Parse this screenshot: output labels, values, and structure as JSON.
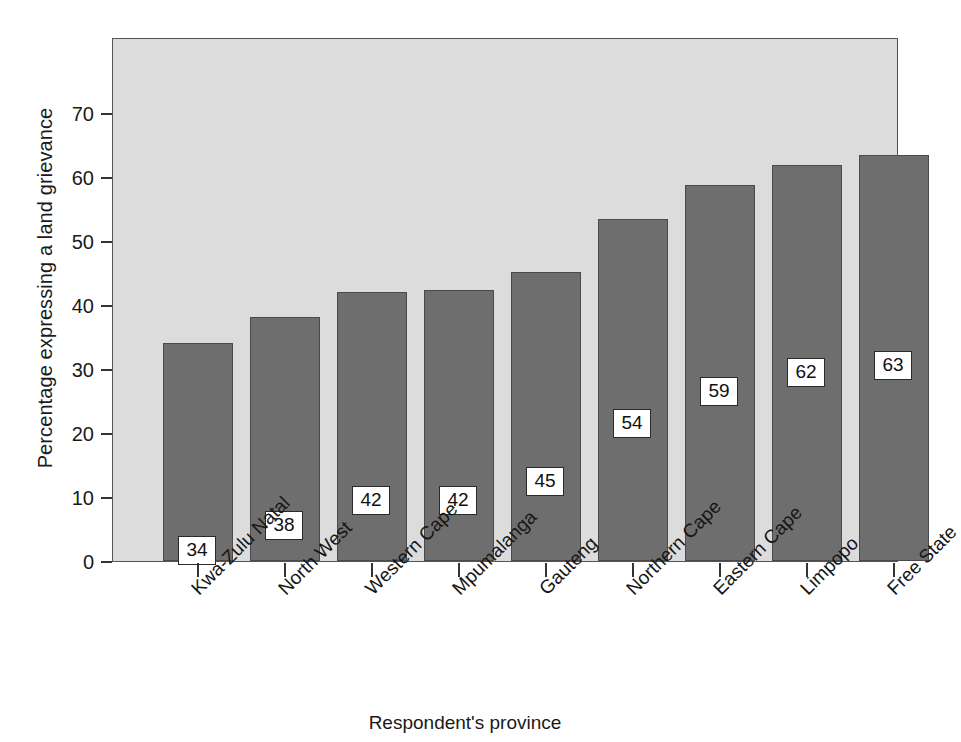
{
  "chart_data": {
    "type": "bar",
    "title": "",
    "xlabel": "Respondent's province",
    "ylabel": "Percentage expressing a land grievance",
    "categories": [
      "Kwa-Zulu Natal",
      "North West",
      "Western Cape",
      "Mpumalanga",
      "Gauteng",
      "Northern Cape",
      "Eastern Cape",
      "Limpopo",
      "Free State"
    ],
    "values": [
      34,
      38,
      42,
      42,
      45,
      54,
      59,
      62,
      63
    ],
    "bar_tops": [
      34.0,
      38.1,
      42.0,
      42.4,
      45.2,
      53.5,
      58.8,
      61.8,
      63.4
    ],
    "data_labels": [
      "34",
      "38",
      "42",
      "42",
      "45",
      "54",
      "59",
      "62",
      "63"
    ],
    "ylim": [
      0,
      74
    ],
    "yticks": [
      0,
      10,
      20,
      30,
      40,
      50,
      60,
      70
    ],
    "ytick_labels": [
      "0",
      "10",
      "20",
      "30",
      "40",
      "50",
      "60",
      "70"
    ],
    "grid": false,
    "legend": false,
    "legend_position": "none",
    "bar_color": "#6e6e6e",
    "bar_edge_color": "#4a4a4a",
    "plot_background": "#dcdcdc",
    "figure_background": "#ffffff",
    "label_box_background": "#ffffff",
    "label_box_border": "#2a2a2a",
    "axis_color": "#333333",
    "label_offsets_from_top": [
      30.0,
      30.2,
      30.2,
      30.5,
      30.3,
      29.6,
      29.9,
      29.9,
      30.5
    ]
  }
}
